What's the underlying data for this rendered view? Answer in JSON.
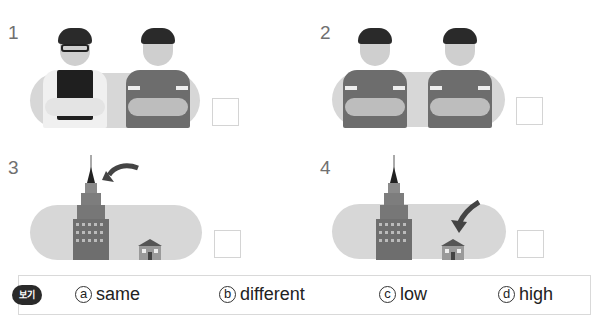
{
  "questions": [
    {
      "number": "1",
      "description": "boy with glasses and vest next to boy in t-shirt"
    },
    {
      "number": "2",
      "description": "two identical boys in t-shirts"
    },
    {
      "number": "3",
      "description": "tall skyscraper with arrow pointing to top, small house"
    },
    {
      "number": "4",
      "description": "tall skyscraper, small house with arrow pointing to it"
    }
  ],
  "legend": {
    "badge": "보기",
    "options": [
      {
        "mark": "a",
        "label": "same"
      },
      {
        "mark": "b",
        "label": "different"
      },
      {
        "mark": "c",
        "label": "low"
      },
      {
        "mark": "d",
        "label": "high"
      }
    ]
  },
  "colors": {
    "pill": "#d7d7d7",
    "box_border": "#d4d4d4",
    "number": "#707070"
  }
}
